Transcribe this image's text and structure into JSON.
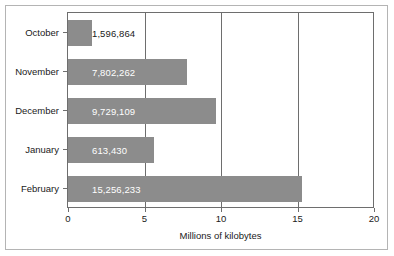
{
  "chart_data": {
    "type": "bar",
    "orientation": "horizontal",
    "title": "",
    "xlabel": "Millions of kilobytes",
    "ylabel": "",
    "categories": [
      "October",
      "November",
      "December",
      "January",
      "February"
    ],
    "values": [
      1.6,
      7.8,
      9.7,
      5.6,
      15.3
    ],
    "data_labels": [
      "1,596,864",
      "7,802,262",
      "9,729,109",
      "613,430",
      "15,256,233"
    ],
    "xlim": [
      0,
      20
    ],
    "xticks": [
      0,
      5,
      10,
      15,
      20
    ],
    "xtick_labels": [
      "0",
      "5",
      "10",
      "15",
      "20"
    ],
    "grid": "vertical",
    "legend": "none",
    "bar_color": "#8c8c8c",
    "axis_color": "#6e6e6e",
    "label_color_inside": "#ffffff",
    "label_color_outside": "#1a1a1a"
  },
  "figure": {
    "frame_color": "#b4b4b4",
    "background": "#ffffff"
  }
}
